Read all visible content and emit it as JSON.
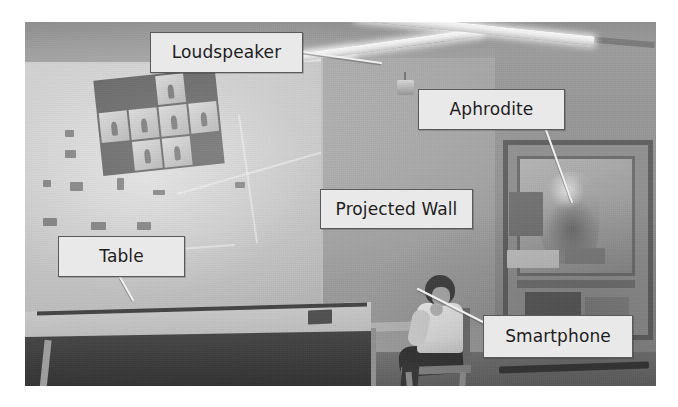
{
  "figure": {
    "kind": "annotated-photograph",
    "scene_description": "Indoor lab room with a projected wall, a table, a seated person holding a smartphone, and a display case",
    "width_px": 678,
    "height_px": 407,
    "photo": {
      "left_px": 25,
      "top_px": 22,
      "width_px": 631,
      "height_px": 364,
      "rendering": "grayscale"
    },
    "background_color": "#ffffff"
  },
  "callouts": [
    {
      "id": "loudspeaker",
      "label": "Loudspeaker",
      "box": {
        "left_px": 150,
        "top_px": 32,
        "width_px": 153,
        "height_px": 41
      },
      "leader": {
        "from_x": 303,
        "from_y": 52,
        "to_x": 381,
        "to_y": 63
      },
      "target": "ceiling-mounted loudspeaker"
    },
    {
      "id": "aphrodite",
      "label": "Aphrodite",
      "box": {
        "left_px": 418,
        "top_px": 89,
        "width_px": 147,
        "height_px": 41
      },
      "leader": {
        "from_x": 546,
        "from_y": 130,
        "to_x": 572,
        "to_y": 202
      },
      "target": "statue inside the display case"
    },
    {
      "id": "projected-wall",
      "label": "Projected Wall",
      "box": {
        "left_px": 320,
        "top_px": 189,
        "width_px": 153,
        "height_px": 40
      },
      "leader": null,
      "target": "large projected wall surface"
    },
    {
      "id": "table",
      "label": "Table",
      "box": {
        "left_px": 58,
        "top_px": 236,
        "width_px": 127,
        "height_px": 41
      },
      "leader": {
        "from_x": 120,
        "from_y": 277,
        "to_x": 133,
        "to_y": 300
      },
      "target": "interactive table surface"
    },
    {
      "id": "smartphone",
      "label": "Smartphone",
      "box": {
        "left_px": 483,
        "top_px": 315,
        "width_px": 150,
        "height_px": 43
      },
      "leader": {
        "from_x": 483,
        "from_y": 322,
        "to_x": 418,
        "to_y": 289
      },
      "target": "smartphone held by the seated person"
    }
  ],
  "colors": {
    "callout_fill": "#e9e9e9",
    "callout_border": "#5a5a5a",
    "callout_text": "#1d1d1d",
    "leader_line": "#efefef",
    "leader_line_shadow": "#555555",
    "page_background": "#ffffff"
  }
}
